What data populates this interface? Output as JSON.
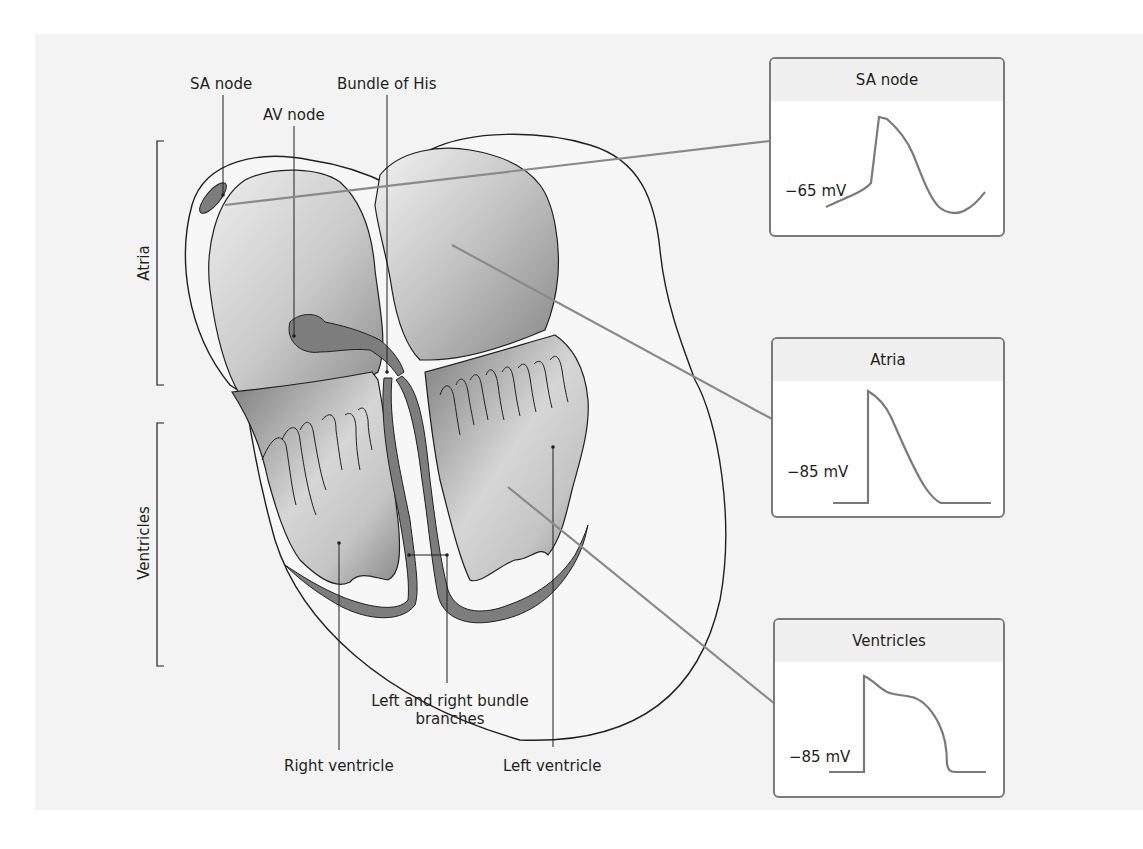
{
  "figure": {
    "background_color": "#f3f3f3",
    "heart_fill_color": "#9a9a9a",
    "conduction_color": "#7d7d7d",
    "connector_color": "#8a8a8a",
    "trace_color": "#7a7a7a"
  },
  "labels": {
    "sa_node": "SA node",
    "av_node": "AV node",
    "bundle_of_his": "Bundle of His",
    "atria": "Atria",
    "ventricles": "Ventricles",
    "bundle_branches": "Left and right bundle branches",
    "bundle_branches_line1": "Left and right bundle",
    "bundle_branches_line2": "branches",
    "right_ventricle": "Right ventricle",
    "left_ventricle": "Left ventricle"
  },
  "action_potentials": [
    {
      "title": "SA node",
      "resting_potential": "−65 mV",
      "shape": "pacemaker"
    },
    {
      "title": "Atria",
      "resting_potential": "−85 mV",
      "shape": "atrial"
    },
    {
      "title": "Ventricles",
      "resting_potential": "−85 mV",
      "shape": "ventricular-plateau"
    }
  ]
}
